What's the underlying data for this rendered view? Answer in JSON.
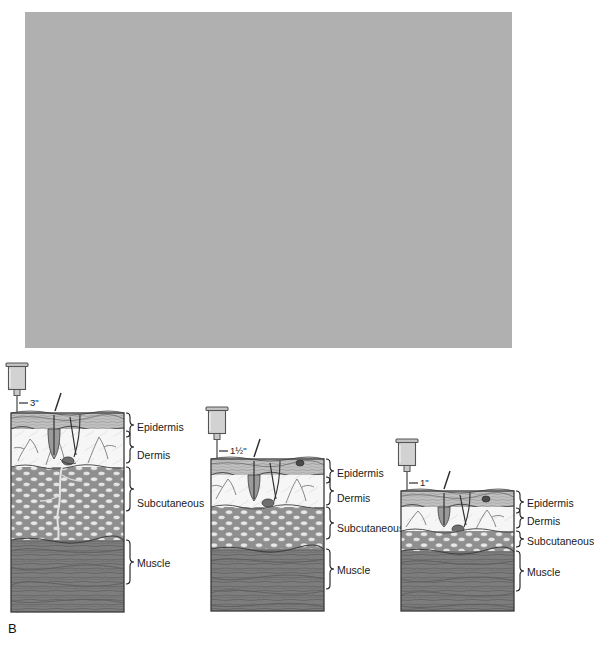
{
  "figure": {
    "panel_a": {
      "letter": "A",
      "background_color": "#b0b0b0",
      "captions": [
        {
          "label": "Overweight adult"
        },
        {
          "label": "Ideal weight adult"
        },
        {
          "label": "Child"
        }
      ],
      "figures": [
        {
          "name": "overweight-adult-silhouette",
          "caption": "Overweight adult"
        },
        {
          "name": "ideal-weight-adult-silhouette",
          "caption": "Ideal weight adult"
        },
        {
          "name": "child-silhouette",
          "caption": "Child"
        }
      ]
    },
    "panel_b": {
      "letter": "B",
      "layer_labels": [
        "Epidermis",
        "Dermis",
        "Subcutaneous",
        "Muscle"
      ],
      "cross_sections": [
        {
          "name": "overweight-adult-cross-section",
          "needle_length": "3\"",
          "layers": [
            "Epidermis",
            "Dermis",
            "Subcutaneous",
            "Muscle"
          ]
        },
        {
          "name": "ideal-weight-adult-cross-section",
          "needle_length": "1½\"",
          "layers": [
            "Epidermis",
            "Dermis",
            "Subcutaneous",
            "Muscle"
          ]
        },
        {
          "name": "child-cross-section",
          "needle_length": "1\"",
          "layers": [
            "Epidermis",
            "Dermis",
            "Subcutaneous",
            "Muscle"
          ]
        }
      ]
    },
    "colors": {
      "panel_background": "#b0b0b0",
      "epidermis": "#bdbdbd",
      "dermis": "#f4f4f4",
      "subcutaneous": "#8e8e8e",
      "fat_cell": "#e8e8e8",
      "muscle": "#7c7c7c",
      "outline": "#000000",
      "syringe": "#d2d2d2"
    }
  }
}
